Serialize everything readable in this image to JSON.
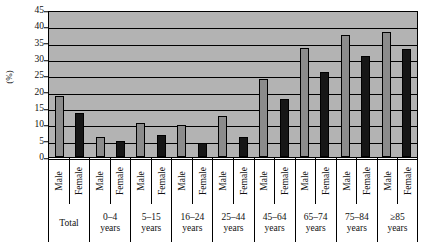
{
  "chart_data": {
    "type": "bar",
    "title": "",
    "xlabel": "",
    "ylabel": "(%)",
    "ylim": [
      0,
      45
    ],
    "ytick_step": 5,
    "yticks": [
      45,
      40,
      35,
      30,
      25,
      20,
      15,
      10,
      5,
      0
    ],
    "grid": true,
    "grid_axis": "y",
    "legend": "none",
    "categories": [
      "Total",
      "0–4 years",
      "5–15 years",
      "16–24 years",
      "25–44 years",
      "45–64 years",
      "65–74 years",
      "75–84 years",
      "≥85 years"
    ],
    "series": [
      {
        "name": "Male",
        "color": "#8c8c8c",
        "values": [
          18.8,
          6.1,
          10.4,
          9.9,
          12.5,
          23.8,
          33.3,
          37.5,
          38.3
        ]
      },
      {
        "name": "Female",
        "color": "#161616",
        "values": [
          13.6,
          4.8,
          6.6,
          4.3,
          6.1,
          17.8,
          26.0,
          31.0,
          33.2
        ]
      }
    ],
    "bars": [
      {
        "group": "Total",
        "sex": "Male",
        "value": 18.8
      },
      {
        "group": "Total",
        "sex": "Female",
        "value": 13.6
      },
      {
        "group": "0–4 years",
        "sex": "Male",
        "value": 6.1
      },
      {
        "group": "0–4 years",
        "sex": "Female",
        "value": 4.8
      },
      {
        "group": "5–15 years",
        "sex": "Male",
        "value": 10.4
      },
      {
        "group": "5–15 years",
        "sex": "Female",
        "value": 6.6
      },
      {
        "group": "16–24 years",
        "sex": "Male",
        "value": 9.9
      },
      {
        "group": "16–24 years",
        "sex": "Female",
        "value": 4.3
      },
      {
        "group": "25–44 years",
        "sex": "Male",
        "value": 12.5
      },
      {
        "group": "25–44 years",
        "sex": "Female",
        "value": 6.1
      },
      {
        "group": "45–64 years",
        "sex": "Male",
        "value": 23.8
      },
      {
        "group": "45–64 years",
        "sex": "Female",
        "value": 17.8
      },
      {
        "group": "65–74 years",
        "sex": "Male",
        "value": 33.3
      },
      {
        "group": "65–74 years",
        "sex": "Female",
        "value": 26.0
      },
      {
        "group": "75–84 years",
        "sex": "Male",
        "value": 37.5
      },
      {
        "group": "75–84 years",
        "sex": "Female",
        "value": 31.0
      },
      {
        "group": "≥85 years",
        "sex": "Male",
        "value": 38.3
      },
      {
        "group": "≥85 years",
        "sex": "Female",
        "value": 33.2
      }
    ],
    "group_labels": [
      {
        "line1": "",
        "line2": "Total"
      },
      {
        "line1": "0–4",
        "line2": "years"
      },
      {
        "line1": "5–15",
        "line2": "years"
      },
      {
        "line1": "16–24",
        "line2": "years"
      },
      {
        "line1": "25–44",
        "line2": "years"
      },
      {
        "line1": "45–64",
        "line2": "years"
      },
      {
        "line1": "65–74",
        "line2": "years"
      },
      {
        "line1": "75–84",
        "line2": "years"
      },
      {
        "line1": "≥85",
        "line2": "years"
      }
    ],
    "sex_labels": [
      "Male",
      "Female"
    ],
    "colors": {
      "plot_background": "#b3b3b3",
      "male_bar": "#8c8c8c",
      "female_bar": "#161616",
      "axis": "#000000",
      "text": "#111111"
    }
  }
}
